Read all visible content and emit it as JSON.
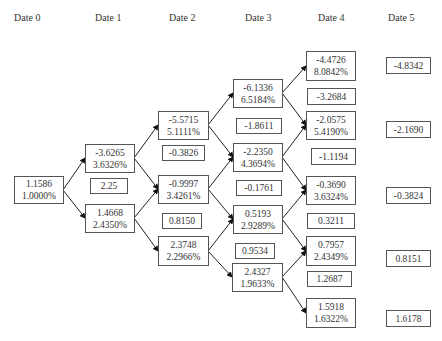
{
  "headers": [
    "Date 0",
    "Date 1",
    "Date 2",
    "Date 3",
    "Date 4",
    "Date 5"
  ],
  "tree": {
    "date0": [
      {
        "value": "1.1586",
        "rate": "1.0000%"
      }
    ],
    "date1": [
      {
        "value": "-3.6265",
        "rate": "3.6326%"
      },
      {
        "value": "1.4668",
        "rate": "2.4350%"
      }
    ],
    "date1_mid": [
      "2.25"
    ],
    "date2": [
      {
        "value": "-5.5715",
        "rate": "5.1111%"
      },
      {
        "value": "-0.9997",
        "rate": "3.4261%"
      },
      {
        "value": "2.3748",
        "rate": "2.2966%"
      }
    ],
    "date2_mid": [
      "-0.3826",
      "0.8150"
    ],
    "date3": [
      {
        "value": "-6.1336",
        "rate": "6.5184%"
      },
      {
        "value": "-2.2350",
        "rate": "4.3694%"
      },
      {
        "value": "0.5193",
        "rate": "2.9289%"
      },
      {
        "value": "2.4327",
        "rate": "1.9633%"
      }
    ],
    "date3_mid": [
      "-1.8611",
      "-0.1761",
      "0.9534"
    ],
    "date4": [
      {
        "value": "-4.4726",
        "rate": "8.0842%"
      },
      {
        "value": "-2.0575",
        "rate": "5.4190%"
      },
      {
        "value": "-0.3690",
        "rate": "3.6324%"
      },
      {
        "value": "0.7957",
        "rate": "2.4349%"
      },
      {
        "value": "1.5918",
        "rate": "1.6322%"
      }
    ],
    "date4_mid": [
      "-3.2684",
      "-1.1194",
      "0.3211",
      "1.2687"
    ],
    "date5": [
      "-4.8342",
      "-2.1690",
      "-0.3824",
      "0.8151",
      "1.6178"
    ]
  }
}
